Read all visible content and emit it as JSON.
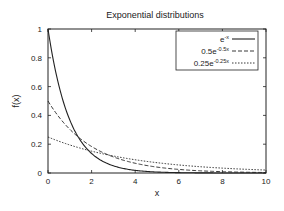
{
  "chart_data": {
    "type": "line",
    "title": "Exponential distributions",
    "xlabel": "x",
    "ylabel": "f(x)",
    "xlim": [
      0,
      10
    ],
    "ylim": [
      0,
      1
    ],
    "grid": false,
    "legend_position": "top-right",
    "xticks": [
      "0",
      "2",
      "4",
      "6",
      "8",
      "10"
    ],
    "yticks": [
      "0",
      "0.2",
      "0.4",
      "0.6",
      "0.8",
      "1"
    ],
    "series": [
      {
        "name": "e^-x",
        "base": "e",
        "exp": "-x",
        "lambda": 1,
        "scale": 1,
        "style": "solid",
        "x": [
          0,
          1,
          2,
          3,
          4,
          5,
          6,
          7,
          8,
          9,
          10
        ],
        "values": [
          1,
          0.368,
          0.135,
          0.05,
          0.018,
          0.007,
          0.002,
          0.001,
          0,
          0,
          0
        ]
      },
      {
        "name": "0.5e^-0.5x",
        "base": "0.5e",
        "exp": "-0.5x",
        "lambda": 0.5,
        "scale": 0.5,
        "style": "dashed",
        "x": [
          0,
          1,
          2,
          3,
          4,
          5,
          6,
          7,
          8,
          9,
          10
        ],
        "values": [
          0.5,
          0.303,
          0.184,
          0.112,
          0.068,
          0.041,
          0.025,
          0.015,
          0.009,
          0.006,
          0.003
        ]
      },
      {
        "name": "0.25e^-0.25x",
        "base": "0.25e",
        "exp": "-0.25x",
        "lambda": 0.25,
        "scale": 0.25,
        "style": "dotted",
        "x": [
          0,
          1,
          2,
          3,
          4,
          5,
          6,
          7,
          8,
          9,
          10
        ],
        "values": [
          0.25,
          0.195,
          0.152,
          0.118,
          0.092,
          0.072,
          0.056,
          0.043,
          0.034,
          0.026,
          0.021
        ]
      }
    ]
  }
}
